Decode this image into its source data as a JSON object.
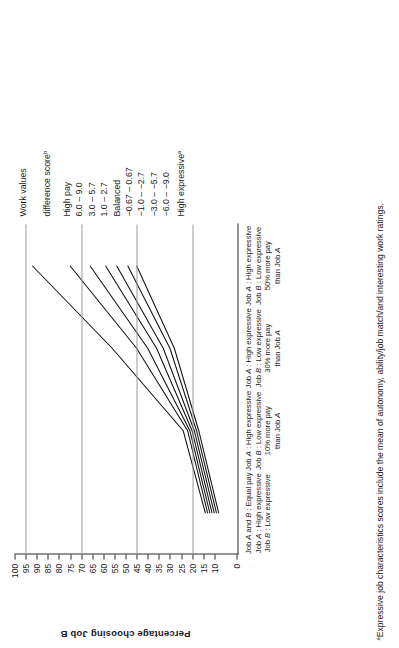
{
  "figure": {
    "footnote": "Expressive job characteristics scores include the mean of autonomy, ability/job match/and interesting work ratings.",
    "footnote_marker": "a"
  },
  "legend": {
    "title_line1": "Work values",
    "title_line2": "difference  score",
    "title_marker": "b",
    "position": "top-right",
    "items": [
      {
        "label": "High pay",
        "marker": ""
      },
      {
        "label": "6.0 – 9.0",
        "marker": ""
      },
      {
        "label": "3.0 – 5.7",
        "marker": ""
      },
      {
        "label": "1.0 – 2.7",
        "marker": ""
      },
      {
        "label": "Balanced",
        "marker": ""
      },
      {
        "label": "−0.67 – 0.67",
        "marker": ""
      },
      {
        "label": "−1.0 – −2.7",
        "marker": ""
      },
      {
        "label": "−3.0 – −5.7",
        "marker": ""
      },
      {
        "label": "−6.0 – −9.0",
        "marker": ""
      },
      {
        "label": "High expressive",
        "marker": "a"
      }
    ]
  },
  "chart_data": {
    "type": "line",
    "title": "",
    "xlabel": "",
    "ylabel": "Percentage choosing Job B",
    "ylim": [
      0,
      100
    ],
    "grid": true,
    "legend_position": "top-right",
    "yticks": [
      0,
      10,
      15,
      20,
      25,
      30,
      35,
      40,
      45,
      50,
      55,
      60,
      65,
      70,
      75,
      80,
      85,
      90,
      95,
      100
    ],
    "ytick_labels": [
      "0",
      "10",
      "15",
      "20",
      "25",
      "30",
      "35",
      "40",
      "45",
      "50",
      "55",
      "60",
      "65",
      "70",
      "75",
      "80",
      "85",
      "90",
      "95",
      "100"
    ],
    "gridlines": [
      20,
      45,
      70,
      95
    ],
    "categories": [
      "Job A and B : Equal pay\nJob A : High expressive\nJob B : Low expressive",
      "Job A : High expressive\nJob B : Low expressive\n10% more pay\nthan Job A",
      "Job A : High expressive\nJob B : Low expressive\n30% more pay\nthan Job A",
      "Job A : High expressive\nJob B : Low expressive\n50% more pay\nthan Job A"
    ],
    "category_lines": [
      [
        "Job A and B : Equal pay",
        "Job A : High expressive",
        "Job B : Low expressive"
      ],
      [
        "Job A : High expressive",
        "Job B : Low expressive",
        "10% more pay",
        "than Job A"
      ],
      [
        "Job A : High expressive",
        "Job B : Low expressive",
        "30% more pay",
        "than Job A"
      ],
      [
        "Job A : High expressive",
        "Job B : Low expressive",
        "50% more pay",
        "than Job A"
      ]
    ],
    "series": [
      {
        "name": "6.0 – 9.0",
        "values": [
          14,
          24,
          56,
          92
        ]
      },
      {
        "name": "3.0 – 5.7",
        "values": [
          13,
          22,
          45,
          75
        ]
      },
      {
        "name": "1.0 – 2.7",
        "values": [
          12,
          21,
          40,
          66
        ]
      },
      {
        "name": "−0.67 – 0.67",
        "values": [
          11,
          20,
          36,
          59
        ]
      },
      {
        "name": "−1.0 – −2.7",
        "values": [
          10,
          19,
          33,
          54
        ]
      },
      {
        "name": "−3.0 – −5.7",
        "values": [
          9,
          18,
          30,
          49
        ]
      },
      {
        "name": "−6.0 – −9.0",
        "values": [
          8,
          17,
          28,
          45
        ]
      }
    ]
  }
}
